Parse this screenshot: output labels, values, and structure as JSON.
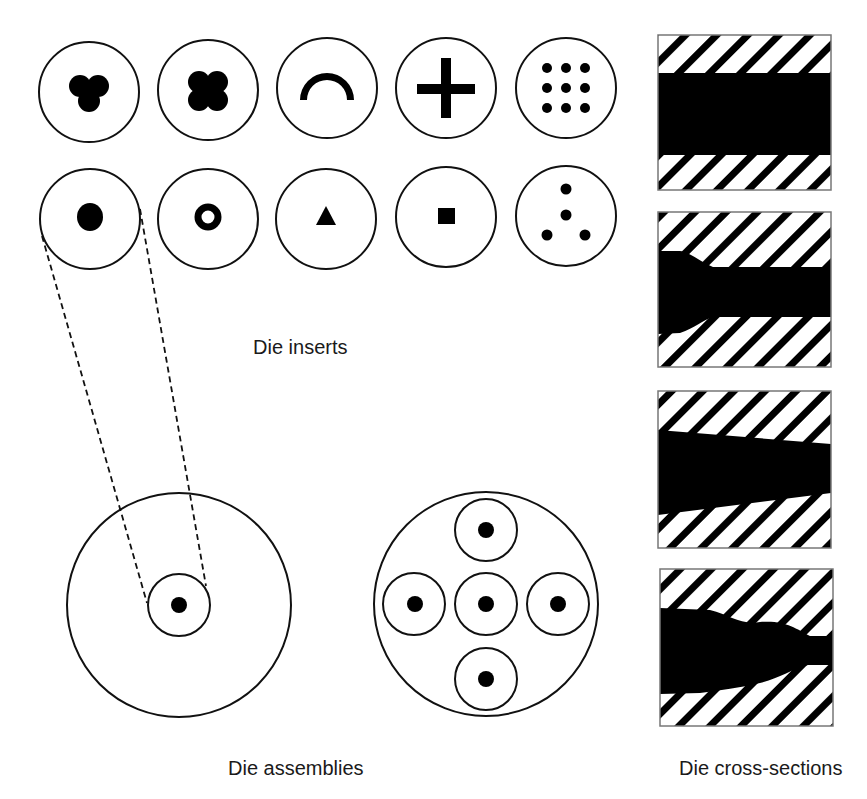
{
  "diagram": {
    "labels": {
      "inserts": "Die inserts",
      "assemblies": "Die assemblies",
      "cross_sections": "Die cross-sections"
    },
    "colors": {
      "stroke": "#111111",
      "fill": "#000000",
      "background": "#ffffff"
    },
    "inserts": [
      {
        "row": 1,
        "col": 1,
        "shape": "trefoil",
        "name": "three-lobed-cluster"
      },
      {
        "row": 1,
        "col": 2,
        "shape": "quatrefoil",
        "name": "four-lobed-cluster"
      },
      {
        "row": 1,
        "col": 3,
        "shape": "arc",
        "name": "half-ring-arc"
      },
      {
        "row": 1,
        "col": 4,
        "shape": "cross",
        "name": "plus-cross"
      },
      {
        "row": 1,
        "col": 5,
        "shape": "dot-grid-3x3",
        "name": "nine-hole-grid"
      },
      {
        "row": 2,
        "col": 1,
        "shape": "dot",
        "name": "single-round-hole"
      },
      {
        "row": 2,
        "col": 2,
        "shape": "ring",
        "name": "hollow-ring"
      },
      {
        "row": 2,
        "col": 3,
        "shape": "triangle",
        "name": "triangle"
      },
      {
        "row": 2,
        "col": 4,
        "shape": "square",
        "name": "square"
      },
      {
        "row": 2,
        "col": 5,
        "shape": "four-dots",
        "name": "four-hole-pattern"
      }
    ],
    "assemblies": [
      {
        "name": "single-insert-assembly",
        "inserts": 1
      },
      {
        "name": "five-insert-assembly",
        "inserts": 5
      }
    ],
    "cross_sections": [
      {
        "index": 1,
        "profile": "straight"
      },
      {
        "index": 2,
        "profile": "stepped-converging"
      },
      {
        "index": 3,
        "profile": "tapered"
      },
      {
        "index": 4,
        "profile": "wavy-converging"
      }
    ]
  }
}
